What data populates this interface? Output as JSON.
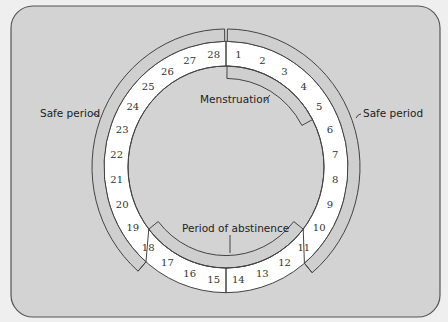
{
  "diagram": {
    "days": [
      "1",
      "2",
      "3",
      "4",
      "5",
      "6",
      "7",
      "8",
      "9",
      "10",
      "11",
      "12",
      "13",
      "14",
      "15",
      "16",
      "17",
      "18",
      "19",
      "20",
      "21",
      "22",
      "23",
      "24",
      "25",
      "26",
      "27",
      "28"
    ],
    "labels": {
      "safe_period_left": "Safe period",
      "safe_period_right": "Safe period",
      "menstruation": "Menstruation",
      "abstinence": "Period of abstinence"
    },
    "phases": [
      {
        "name": "Menstruation",
        "start_day": 1,
        "end_day": 5
      },
      {
        "name": "Safe period",
        "start_day": 1,
        "end_day": 10
      },
      {
        "name": "Period of abstinence",
        "start_day": 11,
        "end_day": 17
      },
      {
        "name": "Safe period",
        "start_day": 18,
        "end_day": 28
      }
    ],
    "colors": {
      "background": "#efefef",
      "panel": "#d3d3d3",
      "band": "#cfcfcf",
      "day_ring": "#ffffff",
      "stroke": "#444444"
    }
  }
}
